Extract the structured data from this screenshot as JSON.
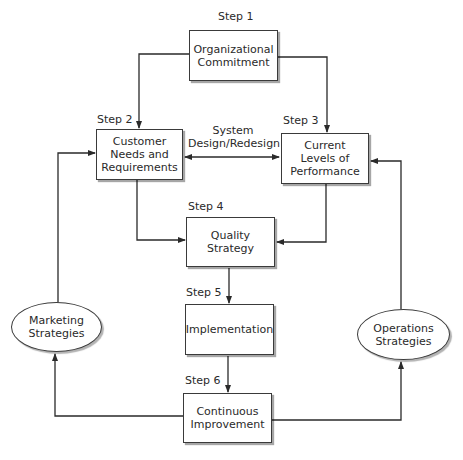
{
  "diagram": {
    "steps": [
      {
        "id": "step1",
        "step_label": "Step 1",
        "text": "Organizational\nCommitment"
      },
      {
        "id": "step2",
        "step_label": "Step 2",
        "text": "Customer\nNeeds and\nRequirements"
      },
      {
        "id": "step3",
        "step_label": "Step 3",
        "text": "Current\nLevels of\nPerformance"
      },
      {
        "id": "step4",
        "step_label": "Step 4",
        "text": "Quality\nStrategy"
      },
      {
        "id": "step5",
        "step_label": "Step 5",
        "text": "Implementation"
      },
      {
        "id": "step6",
        "step_label": "Step 6",
        "text": "Continuous\nImprovement"
      }
    ],
    "side_nodes": {
      "marketing": "Marketing\nStrategies",
      "operations": "Operations\nStrategies"
    },
    "edge_labels": {
      "system_design": "System\nDesign/Redesign"
    },
    "colors": {
      "line": "#2a2a2a",
      "box_fill": "#ffffff",
      "text": "#2a2a2a"
    }
  }
}
